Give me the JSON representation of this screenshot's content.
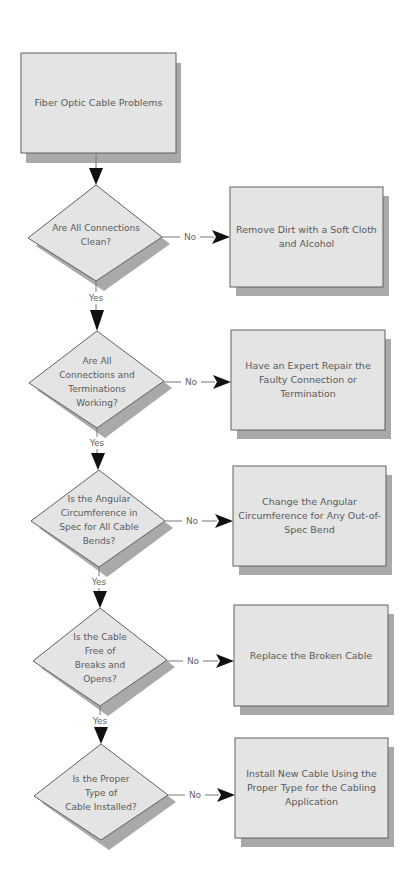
{
  "diagram": {
    "title": "Fiber Optic Cable Problems",
    "colors": {
      "fill": "#e4e4e4",
      "stroke": "#606060",
      "shadow": "#a9a9a9",
      "text": "#5a5a5a",
      "arrow": "#111111",
      "line": "#777777"
    },
    "start": {
      "label": "Fiber Optic Cable Problems"
    },
    "decisions": [
      {
        "label": "Are All Connections\nClean?",
        "no_label": "No",
        "yes_label": "Yes",
        "action": "Remove Dirt with a Soft Cloth\nand Alcohol"
      },
      {
        "label": "Are All\nConnections and\nTerminations\nWorking?",
        "no_label": "No",
        "yes_label": "Yes",
        "action": "Have an Expert Repair the\nFaulty Connection or\nTermination"
      },
      {
        "label": "Is the Angular\nCircumference in\nSpec for All Cable\nBends?",
        "no_label": "No",
        "yes_label": "Yes",
        "action": "Change the Angular\nCircumference for Any Out-of-\nSpec Bend"
      },
      {
        "label": "Is the Cable\nFree of\nBreaks and\nOpens?",
        "no_label": "No",
        "yes_label": "Yes",
        "action": "Replace the Broken Cable"
      },
      {
        "label": "Is the Proper\nType of\nCable Installed?",
        "no_label": "No",
        "action": "Install New Cable Using the\nProper Type for the Cabling\nApplication"
      }
    ]
  }
}
